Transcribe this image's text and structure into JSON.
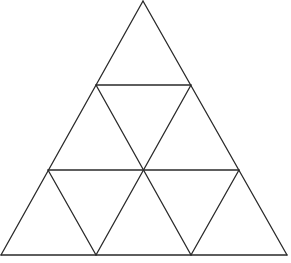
{
  "diagram": {
    "type": "triangle-subdivision",
    "stroke_color": "#2a2a2a",
    "background": "#ffffff",
    "vertices": {
      "apex": [
        143,
        1
      ],
      "row1_left": [
        96,
        85
      ],
      "row1_right": [
        191,
        85
      ],
      "row2_left": [
        48,
        170
      ],
      "row2_mid": [
        143,
        170
      ],
      "row2_right": [
        239,
        170
      ],
      "base_left": [
        1,
        255
      ],
      "base_b1": [
        96,
        255
      ],
      "base_b2": [
        191,
        255
      ],
      "base_right": [
        287,
        255
      ]
    },
    "small_triangle_count": 9
  }
}
